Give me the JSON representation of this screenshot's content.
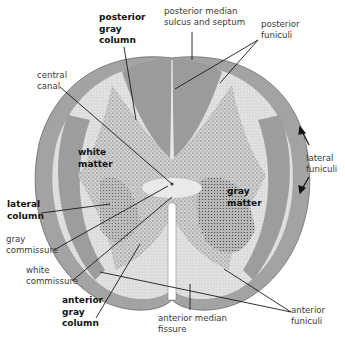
{
  "figure": {
    "colors": {
      "white_matter_dark": "#9a9a9a",
      "white_matter_light": "#d6d6d6",
      "gray_matter": "#c4c4c4",
      "stipple": "#555555",
      "leader_line": "#1a1a1a",
      "label_text": "#3a3a3a",
      "bold_label_text": "#111111"
    }
  },
  "labels": {
    "posterior_gray_column": {
      "line1": "posterior",
      "line2": "gray",
      "line3": "column"
    },
    "posterior_median_sulcus": {
      "line1": "posterior median",
      "line2": "sulcus and septum"
    },
    "posterior_funiculi": {
      "line1": "posterior",
      "line2": "funiculi"
    },
    "central_canal": {
      "line1": "central",
      "line2": "canal"
    },
    "white_matter": {
      "line1": "white",
      "line2": "matter"
    },
    "lateral_funiculi": {
      "line1": "lateral",
      "line2": "funiculi"
    },
    "gray_matter": {
      "line1": "gray",
      "line2": "matter"
    },
    "lateral_column": {
      "line1": "lateral",
      "line2": "column"
    },
    "gray_commissure": {
      "line1": "gray",
      "line2": "commissure"
    },
    "white_commissure": {
      "line1": "white",
      "line2": "commissure"
    },
    "anterior_gray_column": {
      "line1": "anterior",
      "line2": "gray",
      "line3": "column"
    },
    "anterior_median_fissure": {
      "line1": "anterior median",
      "line2": "fissure"
    },
    "anterior_funiculi": {
      "line1": "anterior",
      "line2": "funiculi"
    }
  }
}
